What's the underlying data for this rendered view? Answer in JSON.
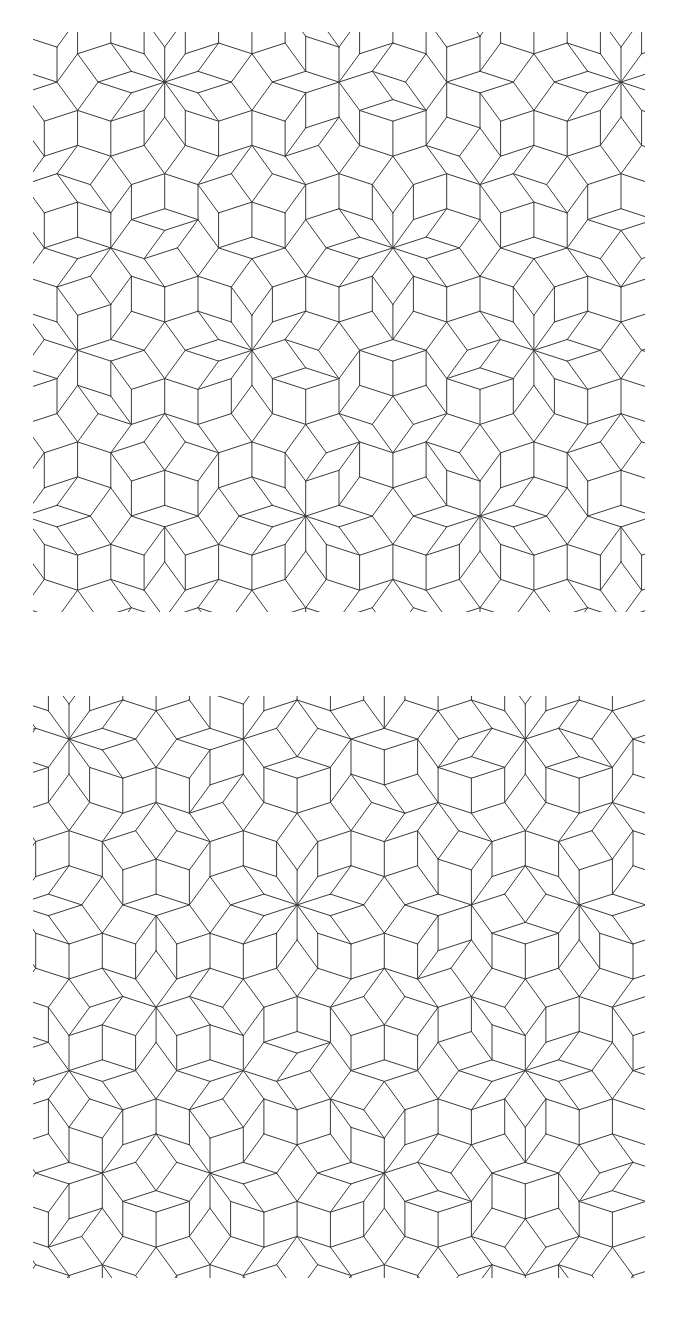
{
  "figure": {
    "background": "#ffffff",
    "line_color": "#3a3a3a",
    "line_width": 1.0
  },
  "panels": [
    {
      "id": "top",
      "x": 33,
      "y": 32,
      "width": 612,
      "height": 580,
      "edge_length": 35,
      "offsets": [
        0.21,
        0.37,
        0.13,
        0.41,
        0.28
      ],
      "rotation_deg": 90,
      "center_shift": [
        0,
        0
      ]
    },
    {
      "id": "bottom",
      "x": 33,
      "y": 696,
      "width": 612,
      "height": 582,
      "edge_length": 35,
      "offsets": [
        0.31,
        0.17,
        0.43,
        0.09,
        0.36
      ],
      "rotation_deg": 90,
      "center_shift": [
        12,
        -8
      ]
    }
  ]
}
